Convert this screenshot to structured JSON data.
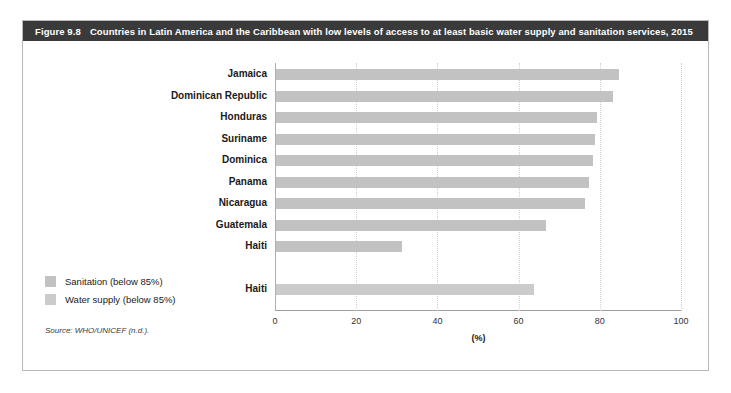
{
  "figure": {
    "number": "Figure 9.8",
    "title": "Countries in Latin America and the Caribbean with low levels of access to at least basic water supply and sanitation services, 2015",
    "source": "Source: WHO/UNICEF (n.d.)."
  },
  "legend": {
    "items": [
      {
        "label": "Sanitation (below 85%)",
        "color": "#c2c2c2",
        "series": "sanitation"
      },
      {
        "label": "Water supply (below 85%)",
        "color": "#cbcbcb",
        "series": "water"
      }
    ]
  },
  "chart_data": {
    "type": "bar",
    "orientation": "horizontal",
    "title": "Countries in Latin America and the Caribbean with low levels of access to at least basic water supply and sanitation services, 2015",
    "xlabel": "(%)",
    "ylabel": "",
    "xlim": [
      0,
      100
    ],
    "xticks": [
      0,
      20,
      40,
      60,
      80,
      100
    ],
    "xtick_labels": [
      "0",
      "20",
      "40",
      "60",
      "80",
      "100"
    ],
    "grid": true,
    "grid_axis": "x",
    "legend_position": "lower-left-outside",
    "categories": [
      "Jamaica",
      "Dominican Republic",
      "Honduras",
      "Suriname",
      "Dominica",
      "Panama",
      "Nicaragua",
      "Guatemala",
      "Haiti",
      "",
      "Haiti"
    ],
    "series": [
      {
        "name": "Sanitation (below 85%)",
        "color": "#c2c2c2",
        "values": [
          84.5,
          83,
          79,
          78.5,
          78,
          77,
          76,
          66.5,
          31,
          null,
          null
        ]
      },
      {
        "name": "Water supply (below 85%)",
        "color": "#cbcbcb",
        "values": [
          null,
          null,
          null,
          null,
          null,
          null,
          null,
          null,
          null,
          null,
          63.5
        ]
      }
    ],
    "bars": [
      {
        "label": "Jamaica",
        "value": 84.5,
        "series": "sanitation"
      },
      {
        "label": "Dominican Republic",
        "value": 83,
        "series": "sanitation"
      },
      {
        "label": "Honduras",
        "value": 79,
        "series": "sanitation"
      },
      {
        "label": "Suriname",
        "value": 78.5,
        "series": "sanitation"
      },
      {
        "label": "Dominica",
        "value": 78,
        "series": "sanitation"
      },
      {
        "label": "Panama",
        "value": 77,
        "series": "sanitation"
      },
      {
        "label": "Nicaragua",
        "value": 76,
        "series": "sanitation"
      },
      {
        "label": "Guatemala",
        "value": 66.5,
        "series": "sanitation"
      },
      {
        "label": "Haiti",
        "value": 31,
        "series": "sanitation"
      },
      {
        "label": "Haiti",
        "value": 63.5,
        "series": "water"
      }
    ]
  }
}
